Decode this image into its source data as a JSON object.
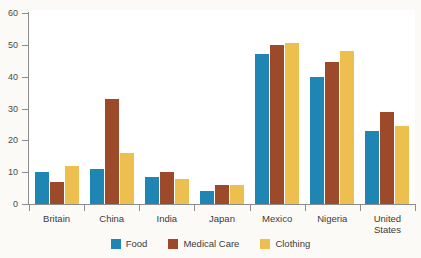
{
  "chart_data": {
    "type": "bar",
    "title": "",
    "xlabel": "",
    "ylabel": "",
    "ylim": [
      0,
      60
    ],
    "yticks": [
      0,
      10,
      20,
      30,
      40,
      50,
      60
    ],
    "grid": false,
    "legend_position": "bottom",
    "categories": [
      "Britain",
      "China",
      "India",
      "Japan",
      "Mexico",
      "Nigeria",
      "United States"
    ],
    "series": [
      {
        "name": "Food",
        "color": "#1f86b4",
        "values": [
          10,
          11,
          8.5,
          4,
          47,
          40,
          23
        ]
      },
      {
        "name": "Medical Care",
        "color": "#9c4a2a",
        "values": [
          7,
          33,
          10,
          6,
          50,
          44.5,
          29
        ]
      },
      {
        "name": "Clothing",
        "color": "#edbf4f",
        "values": [
          12,
          16,
          8,
          6,
          50.5,
          48,
          24.5
        ]
      }
    ]
  },
  "axis": {
    "y_tick_labels": [
      "60",
      "50",
      "40",
      "30",
      "20",
      "10",
      "0"
    ]
  },
  "category_labels": [
    "Britain",
    "China",
    "India",
    "Japan",
    "Mexico",
    "Nigeria",
    "United States"
  ],
  "legend": {
    "items": [
      {
        "label": "Food",
        "color": "#1f86b4"
      },
      {
        "label": "Medical Care",
        "color": "#9c4a2a"
      },
      {
        "label": "Clothing",
        "color": "#edbf4f"
      }
    ]
  }
}
